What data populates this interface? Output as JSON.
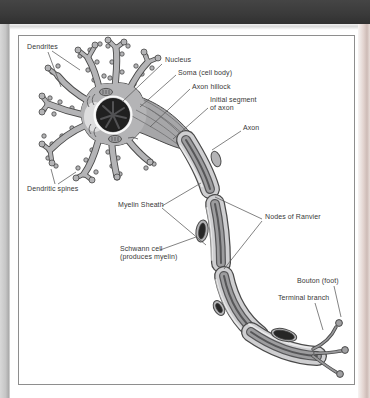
{
  "colors": {
    "top_bar": "#3a3a3a",
    "paper": "#ffffff",
    "left_edge": "#c6c6c6",
    "right_edge": "#e3d4d0",
    "frame_border": "#8e8e8e",
    "ink": "#4a4a4a",
    "cell": "#b4b4b6",
    "cell_dark": "#a6a6a8",
    "myelin": "#cfcfd1",
    "axon_core": "#9c9c9e",
    "nucleus": "#202020"
  },
  "diagram": {
    "labels": {
      "dendrites": "Dendrites",
      "nucleus": "Nucleus",
      "soma": "Soma (cell body)",
      "axon_hillock": "Axon hillock",
      "initial_segment": "Initial segment\nof axon",
      "axon": "Axon",
      "dendritic_spines": "Dendritic spines",
      "myelin_sheath": "Myelin Sheath",
      "nodes_of_ranvier": "Nodes of Ranvier",
      "schwann_cell": "Schwann cell\n(produces myelin)",
      "bouton": "Bouton (foot)",
      "terminal_branch": "Terminal branch"
    }
  }
}
